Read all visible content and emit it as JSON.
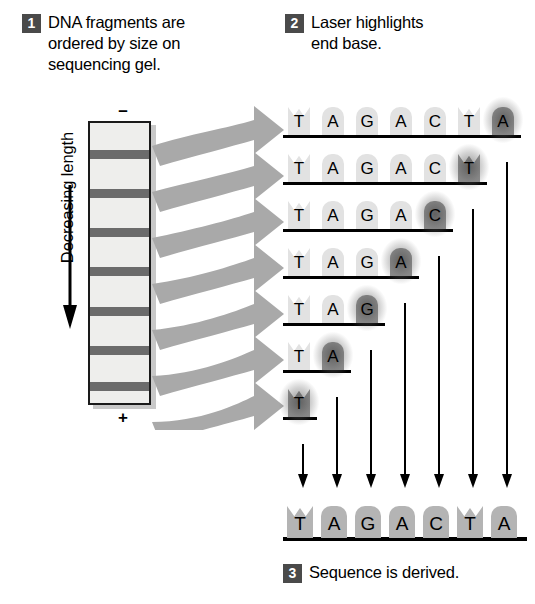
{
  "diagram": {
    "colors": {
      "badge_bg": "#4a4a4a",
      "badge_text": "#ffffff",
      "gel_fill": "#eeeeec",
      "gel_border": "#1a1a1a",
      "gel_band": "#5a5a5a",
      "sweep_arrow": "#a9a9a9",
      "tile_normal": "#e2e2e2",
      "tile_lit": "#8e8e8e",
      "tile_final": "#b4b4b4",
      "ink": "#000000"
    }
  },
  "steps": [
    {
      "number": "1",
      "text": "DNA fragments are\nordered by size on\nsequencing gel."
    },
    {
      "number": "2",
      "text": "Laser highlights\nend base."
    },
    {
      "number": "3",
      "text": "Sequence is derived."
    }
  ],
  "gel": {
    "top_polarity": "–",
    "bottom_polarity": "+",
    "band_count": 7,
    "band_positions_pct": [
      11,
      25,
      39,
      53,
      67,
      81,
      94
    ],
    "axis_label": "Decreasing length",
    "axis_direction": "down"
  },
  "ladder": {
    "rows": [
      {
        "bases": [
          "T",
          "A",
          "G",
          "A",
          "C",
          "T",
          "A"
        ],
        "highlight_index": 6
      },
      {
        "bases": [
          "T",
          "A",
          "G",
          "A",
          "C",
          "T"
        ],
        "highlight_index": 5
      },
      {
        "bases": [
          "T",
          "A",
          "G",
          "A",
          "C"
        ],
        "highlight_index": 4
      },
      {
        "bases": [
          "T",
          "A",
          "G",
          "A"
        ],
        "highlight_index": 3
      },
      {
        "bases": [
          "T",
          "A",
          "G"
        ],
        "highlight_index": 2
      },
      {
        "bases": [
          "T",
          "A"
        ],
        "highlight_index": 1
      },
      {
        "bases": [
          "T"
        ],
        "highlight_index": 0
      }
    ]
  },
  "final_sequence": {
    "bases": [
      "T",
      "A",
      "G",
      "A",
      "C",
      "T",
      "A"
    ],
    "arrow_count": 7
  }
}
